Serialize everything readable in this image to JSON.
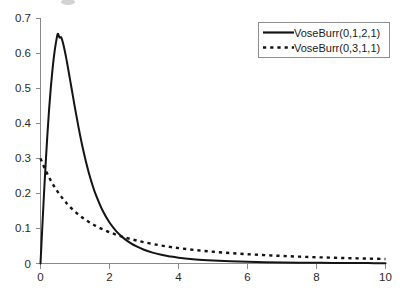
{
  "chart_data": {
    "type": "line",
    "title": "",
    "subtitle": "",
    "xlabel": "",
    "ylabel": "",
    "xlim": [
      0,
      10
    ],
    "ylim": [
      0,
      0.7
    ],
    "grid": false,
    "legend_position": "top-right",
    "x_ticks": [
      "0",
      "2",
      "4",
      "6",
      "8",
      "10"
    ],
    "x_tick_values": [
      0,
      2,
      4,
      6,
      8,
      10
    ],
    "y_ticks": [
      "0",
      "0.1",
      "0.2",
      "0.3",
      "0.4",
      "0.5",
      "0.6",
      "0.7"
    ],
    "y_tick_values": [
      0,
      0.1,
      0.2,
      0.3,
      0.4,
      0.5,
      0.6,
      0.7
    ],
    "x": [
      0,
      0.05,
      0.1,
      0.15,
      0.2,
      0.25,
      0.3,
      0.35,
      0.4,
      0.45,
      0.5,
      0.55,
      0.6,
      0.65,
      0.7,
      0.75,
      0.8,
      0.9,
      1.0,
      1.1,
      1.2,
      1.3,
      1.4,
      1.5,
      1.6,
      1.8,
      2.0,
      2.2,
      2.4,
      2.6,
      2.8,
      3.0,
      3.25,
      3.5,
      3.75,
      4.0,
      4.5,
      5.0,
      5.5,
      6.0,
      6.5,
      7.0,
      7.5,
      8.0,
      8.5,
      9.0,
      9.5,
      10.0
    ],
    "series": [
      {
        "name": "VoseBurr(0,1,2,1)",
        "style": "solid",
        "color": "#141414",
        "values": [
          0,
          0.0999,
          0.1961,
          0.2857,
          0.3676,
          0.4414,
          0.5034,
          0.5563,
          0.5992,
          0.6315,
          0.6554,
          0.6449,
          0.6453,
          0.6298,
          0.6087,
          0.5839,
          0.5565,
          0.5,
          0.4433,
          0.3897,
          0.3408,
          0.2973,
          0.2591,
          0.2259,
          0.1973,
          0.1511,
          0.1171,
          0.0919,
          0.0731,
          0.0588,
          0.0479,
          0.0394,
          0.0311,
          0.0249,
          0.0203,
          0.0167,
          0.0116,
          0.0084,
          0.0062,
          0.0047,
          0.0036,
          0.0029,
          0.0023,
          0.0019,
          0.0015,
          0.0013,
          0.0011,
          0.0009
        ],
        "peak": {
          "x": 0.6,
          "y": 0.645
        }
      },
      {
        "name": "VoseBurr(0,3,1,1)",
        "style": "dotted",
        "color": "#141414",
        "values": [
          0.3,
          0.2877,
          0.2762,
          0.2653,
          0.2551,
          0.2454,
          0.2363,
          0.2277,
          0.2196,
          0.2119,
          0.2045,
          0.1976,
          0.1909,
          0.1846,
          0.1786,
          0.1728,
          0.1673,
          0.1571,
          0.1479,
          0.1395,
          0.1319,
          0.125,
          0.1186,
          0.1127,
          0.1073,
          0.0977,
          0.0893,
          0.0821,
          0.0757,
          0.0701,
          0.0652,
          0.0607,
          0.0557,
          0.0513,
          0.0474,
          0.044,
          0.0382,
          0.0336,
          0.0298,
          0.0266,
          0.0239,
          0.0216,
          0.0196,
          0.0179,
          0.0164,
          0.0151,
          0.014,
          0.0129
        ],
        "start": {
          "x": 0.0,
          "y": 0.3
        }
      }
    ],
    "legend": [
      {
        "label": "VoseBurr(0,1,2,1)",
        "style": "solid"
      },
      {
        "label": "VoseBurr(0,3,1,1)",
        "style": "dotted"
      }
    ],
    "axis_color": "#8a8a8a",
    "background_color": "#ffffff"
  }
}
